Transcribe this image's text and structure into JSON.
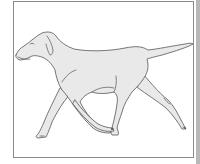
{
  "figure": {
    "alt": "Line drawing of a short-haired dog trotting to the left",
    "colors": {
      "outline": "#555555",
      "fill": "#e9e9e9",
      "frame_border": "#8a8a8a",
      "background": "#ffffff",
      "side_strip": "#b8b8b8"
    }
  }
}
